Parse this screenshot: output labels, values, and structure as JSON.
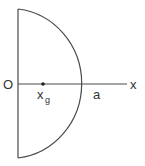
{
  "diagram": {
    "title": "",
    "shape": "semicircle",
    "labels": {
      "origin": "O",
      "x_axis": "x",
      "centroid_main": "x",
      "centroid_sub": "g",
      "radius_point": "a"
    },
    "colors": {
      "stroke": "#4a4a4a",
      "text": "#333333",
      "background": "#ffffff"
    }
  }
}
